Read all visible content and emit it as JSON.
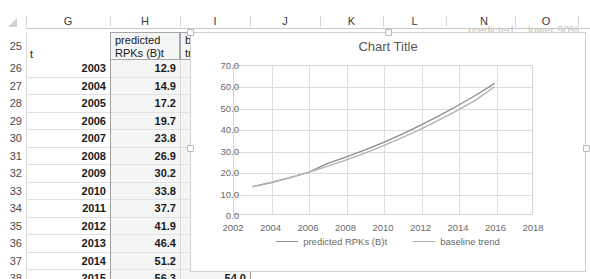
{
  "spreadsheet": {
    "column_headers": [
      "G",
      "H",
      "I",
      "J",
      "K",
      "L",
      "M",
      "N",
      "O"
    ],
    "row_headers": [
      "25",
      "26",
      "27",
      "28",
      "29",
      "30",
      "31",
      "32",
      "33",
      "34",
      "35",
      "36",
      "37",
      "38"
    ],
    "header_row": {
      "g": "t",
      "h": "predicted RPKs (B)t",
      "i": "baseline trend",
      "j_partial": "lc"
    },
    "obscured_headers": {
      "n": "predicted",
      "o": "lower 90%"
    },
    "columns": [
      "t",
      "predicted RPKs (B)t",
      "baseline trend"
    ],
    "rows": [
      {
        "row": "26",
        "t": "2003",
        "predicted": "12.9",
        "baseline": "12.9"
      },
      {
        "row": "27",
        "t": "2004",
        "predicted": "14.9",
        "baseline": "14.9"
      },
      {
        "row": "28",
        "t": "2005",
        "predicted": "17.2",
        "baseline": "17.2"
      },
      {
        "row": "29",
        "t": "2006",
        "predicted": "19.7",
        "baseline": "19.7"
      },
      {
        "row": "30",
        "t": "2007",
        "predicted": "23.8",
        "baseline": "22.5"
      },
      {
        "row": "31",
        "t": "2008",
        "predicted": "26.9",
        "baseline": "25.5"
      },
      {
        "row": "32",
        "t": "2009",
        "predicted": "30.2",
        "baseline": "28.7"
      },
      {
        "row": "33",
        "t": "2010",
        "predicted": "33.8",
        "baseline": "32.2"
      },
      {
        "row": "34",
        "t": "2011",
        "predicted": "37.7",
        "baseline": "36.0"
      },
      {
        "row": "35",
        "t": "2012",
        "predicted": "41.9",
        "baseline": "40.0"
      },
      {
        "row": "36",
        "t": "2013",
        "predicted": "46.4",
        "baseline": "44.4"
      },
      {
        "row": "37",
        "t": "2014",
        "predicted": "51.2",
        "baseline": "49.0"
      },
      {
        "row": "38",
        "t": "2015",
        "predicted": "56.3",
        "baseline": "54.0"
      }
    ]
  },
  "chart_data": {
    "type": "line",
    "title": "Chart Title",
    "xlabel": "",
    "ylabel": "",
    "xlim": [
      2002,
      2018
    ],
    "ylim": [
      0,
      70
    ],
    "grid": true,
    "legend_position": "bottom",
    "x_ticks": [
      "2002",
      "2004",
      "2006",
      "2008",
      "2010",
      "2012",
      "2014",
      "2016",
      "2018"
    ],
    "y_ticks": [
      "0.0",
      "10.0",
      "20.0",
      "30.0",
      "40.0",
      "50.0",
      "60.0",
      "70.0"
    ],
    "x": [
      2003,
      2004,
      2005,
      2006,
      2007,
      2008,
      2009,
      2010,
      2011,
      2012,
      2013,
      2014,
      2015,
      2016
    ],
    "series": [
      {
        "name": "predicted RPKs (B)t",
        "color": "#8c8c8c",
        "values": [
          12.9,
          14.9,
          17.2,
          19.7,
          23.8,
          26.9,
          30.2,
          33.8,
          37.7,
          41.9,
          46.4,
          51.2,
          56.3,
          61.8
        ]
      },
      {
        "name": "baseline trend",
        "color": "#a8a8a8",
        "values": [
          12.9,
          14.9,
          17.2,
          19.7,
          22.5,
          25.5,
          28.7,
          32.2,
          36.0,
          40.0,
          44.4,
          49.0,
          54.0,
          60.3
        ]
      }
    ]
  },
  "colors": {
    "grid": "#dedede",
    "plot_border": "#d3d3d3",
    "axis_text": "#6a6a6a",
    "title_text": "#575757",
    "header_tint": "#eceded"
  }
}
